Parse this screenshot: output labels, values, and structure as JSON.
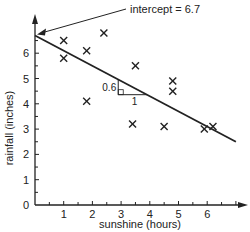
{
  "chart_data": {
    "type": "scatter",
    "title": "",
    "xlabel": "sunshine (hours)",
    "ylabel": "rainfall (inches)",
    "xlim": [
      0,
      7
    ],
    "ylim": [
      0,
      7
    ],
    "x_ticks": [
      1,
      2,
      3,
      4,
      5,
      6
    ],
    "y_ticks": [
      0,
      1,
      2,
      3,
      4,
      5,
      6
    ],
    "origin_label": "0",
    "grid": false,
    "points": [
      {
        "x": 1.0,
        "y": 6.5
      },
      {
        "x": 1.0,
        "y": 5.8
      },
      {
        "x": 1.8,
        "y": 6.1
      },
      {
        "x": 1.8,
        "y": 4.1
      },
      {
        "x": 2.4,
        "y": 6.8
      },
      {
        "x": 3.5,
        "y": 5.5
      },
      {
        "x": 3.4,
        "y": 3.2
      },
      {
        "x": 4.8,
        "y": 4.9
      },
      {
        "x": 4.8,
        "y": 4.5
      },
      {
        "x": 4.5,
        "y": 3.1
      },
      {
        "x": 5.9,
        "y": 3.0
      },
      {
        "x": 6.2,
        "y": 3.1
      }
    ],
    "regression_line": {
      "intercept": 6.7,
      "slope": -0.6,
      "x_start": 0,
      "x_end": 7.0
    },
    "annotations": {
      "intercept_label": "intercept = 6.7",
      "slope_rise_label": "0.6",
      "slope_run_label": "1"
    },
    "marker": "x",
    "color": "#222222"
  }
}
